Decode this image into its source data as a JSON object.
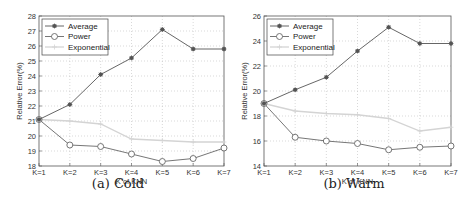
{
  "chart_data": [
    {
      "type": "line",
      "title": "(a) Cold",
      "xlabel": "K of KNN",
      "ylabel": "Relative Error(%)",
      "categories": [
        "K=1",
        "K=2",
        "K=3",
        "K=4",
        "K=5",
        "K=6",
        "K=7"
      ],
      "ylim": [
        18,
        28
      ],
      "yticks": [
        18,
        19,
        20,
        21,
        22,
        23,
        24,
        25,
        26,
        27,
        28
      ],
      "grid": true,
      "legend_position": "upper left",
      "series": [
        {
          "name": "Average",
          "marker": "asterisk",
          "color": "#555555",
          "values": [
            21.1,
            22.1,
            24.1,
            25.2,
            27.1,
            25.8,
            25.8
          ]
        },
        {
          "name": "Power",
          "marker": "circle",
          "color": "#666666",
          "values": [
            21.1,
            19.4,
            19.3,
            18.8,
            18.3,
            18.5,
            19.2
          ]
        },
        {
          "name": "Exponential",
          "marker": "plus",
          "color": "#d4d4d4",
          "values": [
            21.1,
            21.0,
            20.8,
            19.8,
            19.7,
            19.6,
            19.6
          ]
        }
      ]
    },
    {
      "type": "line",
      "title": "(b) Warm",
      "xlabel": "K of KNN",
      "ylabel": "Relative Error(%)",
      "categories": [
        "K=1",
        "K=2",
        "K=3",
        "K=4",
        "K=5",
        "K=6",
        "K=7"
      ],
      "ylim": [
        14,
        26
      ],
      "yticks": [
        14,
        16,
        18,
        20,
        22,
        24,
        26
      ],
      "grid": true,
      "legend_position": "upper left",
      "series": [
        {
          "name": "Average",
          "marker": "asterisk",
          "color": "#555555",
          "values": [
            19.0,
            20.1,
            21.1,
            23.2,
            25.1,
            23.8,
            23.8
          ]
        },
        {
          "name": "Power",
          "marker": "circle",
          "color": "#666666",
          "values": [
            19.0,
            16.3,
            16.0,
            15.8,
            15.3,
            15.5,
            15.6
          ]
        },
        {
          "name": "Exponential",
          "marker": "plus",
          "color": "#d4d4d4",
          "values": [
            19.0,
            18.4,
            18.2,
            18.1,
            17.8,
            16.8,
            17.1
          ]
        }
      ]
    }
  ],
  "captions": {
    "a": "(a) Cold",
    "b": "(b) Warm"
  }
}
